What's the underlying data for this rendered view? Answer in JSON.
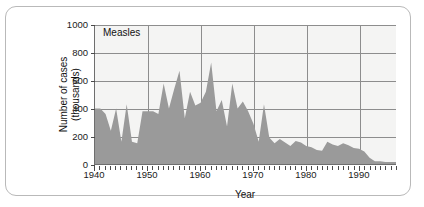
{
  "figure": {
    "frame_border_color": "#b9b9b9",
    "plot_background": "#f4f4f3",
    "area_fill_color": "#9a9a9a",
    "grid_color": "#8d8d8d",
    "axis_color": "#6e6e6e"
  },
  "chart_data": {
    "type": "area",
    "title": "Measles",
    "xlabel": "Year",
    "ylabel": "Number of cases\n(thousands)",
    "ylabel_line1": "Number of cases",
    "ylabel_line2": "(thousands)",
    "xlim": [
      1940,
      1997
    ],
    "ylim": [
      0,
      1000
    ],
    "ytick_values": [
      0,
      200,
      400,
      600,
      800,
      1000
    ],
    "ytick_labels": [
      "0",
      "200",
      "400",
      "600",
      "800",
      "1000"
    ],
    "xtick_values": [
      1940,
      1950,
      1960,
      1970,
      1980,
      1990
    ],
    "xtick_labels": [
      "1940",
      "1950",
      "1960",
      "1970",
      "1980",
      "1990"
    ],
    "x_minor_tick_interval": 1,
    "grid": true,
    "legend": null,
    "units": "thousands of cases",
    "x": [
      1940,
      1941,
      1942,
      1943,
      1944,
      1945,
      1946,
      1947,
      1948,
      1949,
      1950,
      1951,
      1952,
      1953,
      1954,
      1955,
      1956,
      1957,
      1958,
      1959,
      1960,
      1961,
      1962,
      1963,
      1964,
      1965,
      1966,
      1967,
      1968,
      1969,
      1970,
      1971,
      1972,
      1973,
      1974,
      1975,
      1976,
      1977,
      1978,
      1979,
      1980,
      1981,
      1982,
      1983,
      1984,
      1985,
      1986,
      1987,
      1988,
      1989,
      1990,
      1991,
      1992,
      1993,
      1994,
      1995,
      1996,
      1997
    ],
    "values": [
      400,
      400,
      360,
      240,
      400,
      160,
      430,
      160,
      150,
      380,
      380,
      380,
      360,
      580,
      400,
      540,
      670,
      330,
      520,
      420,
      440,
      520,
      730,
      380,
      460,
      270,
      580,
      400,
      450,
      380,
      290,
      160,
      430,
      190,
      150,
      180,
      155,
      130,
      165,
      155,
      130,
      120,
      100,
      95,
      160,
      140,
      130,
      150,
      135,
      115,
      110,
      90,
      45,
      20,
      20,
      15,
      15,
      15
    ],
    "annotations": []
  }
}
